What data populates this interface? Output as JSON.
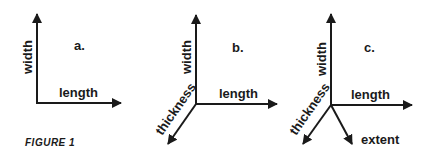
{
  "figure": {
    "caption": "FIGURE 1",
    "panels": [
      {
        "id": "a",
        "label": "a.",
        "axes": [
          {
            "name": "width",
            "direction": "up"
          },
          {
            "name": "length",
            "direction": "right"
          }
        ]
      },
      {
        "id": "b",
        "label": "b.",
        "axes": [
          {
            "name": "width",
            "direction": "up"
          },
          {
            "name": "length",
            "direction": "right"
          },
          {
            "name": "thickness",
            "direction": "down-left"
          }
        ]
      },
      {
        "id": "c",
        "label": "c.",
        "axes": [
          {
            "name": "width",
            "direction": "up"
          },
          {
            "name": "length",
            "direction": "right"
          },
          {
            "name": "thickness",
            "direction": "down-left"
          },
          {
            "name": "extent",
            "direction": "down-right"
          }
        ]
      }
    ]
  },
  "colors": {
    "ink": "#1a1a1a",
    "background": "#ffffff"
  }
}
